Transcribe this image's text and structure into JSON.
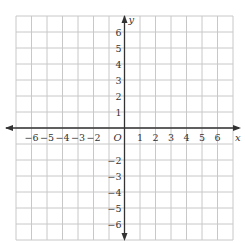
{
  "diagram": {
    "type": "coordinate-plane",
    "x_axis": {
      "name": "x",
      "min": -7,
      "max": 7,
      "tick_labels": [
        "−6",
        "−5",
        "−4",
        "−3",
        "−2",
        "1",
        "2",
        "3",
        "4",
        "5",
        "6"
      ],
      "tick_values": [
        -6,
        -5,
        -4,
        -3,
        -2,
        1,
        2,
        3,
        4,
        5,
        6
      ]
    },
    "y_axis": {
      "name": "y",
      "min": -7,
      "max": 7,
      "tick_labels": [
        "6",
        "5",
        "4",
        "3",
        "2",
        "1",
        "−2",
        "−3",
        "−4",
        "−5",
        "−6"
      ],
      "tick_values": [
        6,
        5,
        4,
        3,
        2,
        1,
        -2,
        -3,
        -4,
        -5,
        -6
      ]
    },
    "origin_label": "O",
    "grid": {
      "columns": 14,
      "rows": 14,
      "line_color": "#c8c8c8",
      "axis_color": "#333333"
    }
  }
}
